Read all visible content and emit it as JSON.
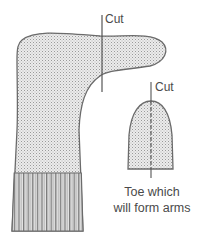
{
  "diagram": {
    "labels": {
      "cut_top": "Cut",
      "cut_toe": "Cut",
      "caption_line1": "Toe which",
      "caption_line2": "will form arms"
    },
    "parts": [
      {
        "name": "sock-body",
        "description": "Sock with heel, stippled fabric, ribbed cuff at bottom"
      },
      {
        "name": "toe-piece",
        "description": "Cut-off toe with dashed center line"
      }
    ],
    "colors": {
      "outline": "#6b6b6b",
      "fill": "#d9d9d9",
      "text": "#4a4a4a"
    }
  }
}
